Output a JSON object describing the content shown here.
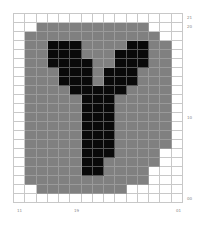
{
  "colors": {
    "W": "#ffffff",
    "G": "#808080",
    "B": "#0a0a0a"
  },
  "grid": {
    "cols": 15,
    "rows": [
      "WWWWWWWWWWWWWWW",
      "WWGGGGGGGGGGWWW",
      "WGGGGGGGGGGGGWW",
      "WGGBBBGGGGBBGGW",
      "WGGBBBGGGBBBGGW",
      "WGGBBBBGGBBBGGW",
      "WGGGBBBGBBBGGGW",
      "WGGGBBBGBBBGGGW",
      "WGGGGBBBBBGGGGW",
      "WGGGGGBBBGGGGGW",
      "WGGGGGBBBGGGGGW",
      "WGGGGGBBBGGGGGW",
      "WGGGGGBBBGGGGGW",
      "WGGGGGBBBGGGGGW",
      "WGGGGGBBBGGGGGW",
      "WGGGGGBBBGGGGWW",
      "WGGGGGBBGGGGGWW",
      "WGGGGGBBGGGGWWW",
      "WGGGGGGGGGGGWWW",
      "WWGGGGGGGGWWWWW",
      "WWWWWWWWWWWWWWW"
    ]
  },
  "labels": {
    "right_top_1": "21",
    "right_top_2": "20",
    "right_mid": "10",
    "right_bottom": "00",
    "bottom_left": "11",
    "bottom_mid": "19",
    "bottom_right": "01"
  }
}
